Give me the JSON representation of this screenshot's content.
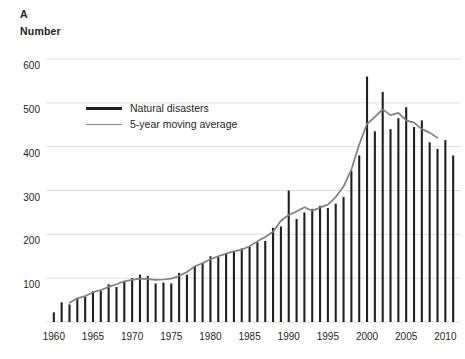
{
  "panel": {
    "label": "A"
  },
  "axis_title": "Number",
  "legend": {
    "items": [
      {
        "label": "Natural disasters",
        "style": "thick-black",
        "color": "#231f20"
      },
      {
        "label": "5-year moving average",
        "style": "thin-gray",
        "color": "#808080"
      }
    ]
  },
  "chart_data": {
    "type": "bar",
    "title": "Number",
    "panel": "A",
    "xlabel": "",
    "ylabel": "Number",
    "ylim": [
      0,
      600
    ],
    "yticks": [
      100,
      200,
      300,
      400,
      500,
      600
    ],
    "ytick_labels": [
      "100",
      "200",
      "300",
      "400",
      "500",
      "600"
    ],
    "xlim": [
      1959,
      2012
    ],
    "xticks": [
      1960,
      1965,
      1970,
      1975,
      1980,
      1985,
      1990,
      1995,
      2000,
      2005,
      2010
    ],
    "xtick_labels": [
      "1960",
      "1965",
      "1970",
      "1975",
      "1980",
      "1985",
      "1990",
      "1995",
      "2000",
      "2005",
      "2010"
    ],
    "grid": "horizontal",
    "legend_position": "upper-left-inside",
    "categories": [
      1960,
      1961,
      1962,
      1963,
      1964,
      1965,
      1966,
      1967,
      1968,
      1969,
      1970,
      1971,
      1972,
      1973,
      1974,
      1975,
      1976,
      1977,
      1978,
      1979,
      1980,
      1981,
      1982,
      1983,
      1984,
      1985,
      1986,
      1987,
      1988,
      1989,
      1990,
      1991,
      1992,
      1993,
      1994,
      1995,
      1996,
      1997,
      1998,
      1999,
      2000,
      2001,
      2002,
      2003,
      2004,
      2005,
      2006,
      2007,
      2008,
      2009,
      2010,
      2011
    ],
    "series": [
      {
        "name": "Natural disasters",
        "type": "bar",
        "color": "#231f20",
        "values": [
          22,
          45,
          40,
          55,
          58,
          70,
          72,
          86,
          80,
          92,
          100,
          108,
          105,
          88,
          90,
          88,
          112,
          108,
          128,
          135,
          150,
          148,
          155,
          160,
          168,
          172,
          182,
          185,
          215,
          218,
          300,
          235,
          250,
          258,
          265,
          260,
          270,
          285,
          345,
          380,
          560,
          435,
          525,
          440,
          465,
          490,
          445,
          460,
          410,
          395,
          415,
          380
        ]
      },
      {
        "name": "5-year moving average",
        "type": "line",
        "color": "#808080",
        "x": [
          1962,
          1963,
          1964,
          1965,
          1966,
          1967,
          1968,
          1969,
          1970,
          1971,
          1972,
          1973,
          1974,
          1975,
          1976,
          1977,
          1978,
          1979,
          1980,
          1981,
          1982,
          1983,
          1984,
          1985,
          1986,
          1987,
          1988,
          1989,
          1990,
          1991,
          1992,
          1993,
          1994,
          1995,
          1996,
          1997,
          1998,
          1999,
          2000,
          2001,
          2002,
          2003,
          2004,
          2005,
          2006,
          2007,
          2008,
          2009
        ],
        "values": [
          44,
          54,
          59,
          68,
          73,
          80,
          86,
          93,
          96,
          99,
          98,
          96,
          97,
          99,
          105,
          114,
          127,
          134,
          143,
          150,
          156,
          161,
          165,
          173,
          184,
          194,
          206,
          231,
          244,
          252,
          262,
          254,
          261,
          268,
          285,
          309,
          348,
          405,
          452,
          468,
          485,
          472,
          477,
          460,
          455,
          440,
          432,
          420
        ]
      }
    ]
  }
}
